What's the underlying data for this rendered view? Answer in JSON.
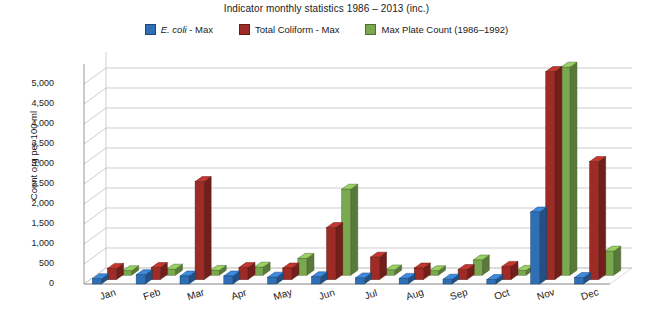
{
  "chart_data": {
    "type": "bar",
    "title": "Indicator monthly statistics 1986 – 2013 (inc.)",
    "xlabel": "",
    "ylabel": "Count org per 100 ml",
    "categories": [
      "Jan",
      "Feb",
      "Mar",
      "Apr",
      "May",
      "Jun",
      "Jul",
      "Aug",
      "Sep",
      "Oct",
      "Nov",
      "Dec"
    ],
    "ylim": [
      0,
      5500
    ],
    "yticks": [
      0,
      500,
      1000,
      1500,
      2000,
      2500,
      3000,
      3500,
      4000,
      4500,
      5000
    ],
    "ytick_labels": [
      "0",
      "500",
      "1,000",
      "1,500",
      "2,000",
      "2,500",
      "3,000",
      "3,500",
      "4,000",
      "4,500",
      "5,000"
    ],
    "grid": true,
    "legend_position": "top",
    "series": [
      {
        "name": "E. coli - Max",
        "color": "#2f6fb5",
        "values": [
          130,
          230,
          200,
          200,
          170,
          180,
          150,
          140,
          120,
          110,
          1800,
          160
        ]
      },
      {
        "name": "Total Coliform - Max",
        "color": "#9e2b25",
        "values": [
          280,
          300,
          2450,
          300,
          290,
          1300,
          560,
          290,
          250,
          330,
          5200,
          2950
        ]
      },
      {
        "name": "Max Plate Count (1986–1992)",
        "color": "#7aa84f",
        "values": [
          110,
          150,
          120,
          200,
          420,
          2150,
          130,
          110,
          380,
          120,
          5200,
          600
        ]
      }
    ]
  },
  "legend": {
    "items": [
      {
        "label_prefix": "E. coli",
        "label_suffix": " - Max",
        "color": "#2f6fb5"
      },
      {
        "label_prefix": "",
        "label_suffix": "Total Coliform - Max",
        "color": "#9e2b25"
      },
      {
        "label_prefix": "",
        "label_suffix": "Max Plate Count (1986–1992)",
        "color": "#7aa84f"
      }
    ]
  }
}
